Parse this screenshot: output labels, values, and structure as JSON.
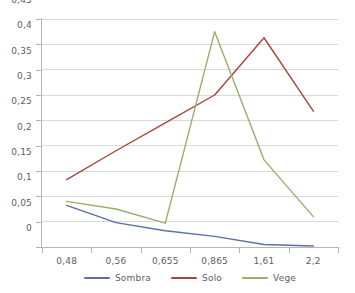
{
  "chart_data": {
    "type": "line",
    "title": "",
    "subtitle": "",
    "xlabel": "",
    "ylabel": "",
    "categories": [
      "0,48",
      "0,56",
      "0,655",
      "0,865",
      "1,61",
      "2,2"
    ],
    "series": [
      {
        "name": "Sombra",
        "color": "#5b6fa8",
        "values": [
          0.082,
          0.048,
          0.032,
          0.021,
          0.005,
          0.002
        ]
      },
      {
        "name": "Solo",
        "color": "#a8453a",
        "values": [
          0.133,
          0.19,
          0.245,
          0.3,
          0.413,
          0.268
        ]
      },
      {
        "name": "Vege",
        "color": "#9aae6b",
        "values": [
          0.09,
          0.075,
          0.047,
          0.425,
          0.172,
          0.06
        ]
      }
    ],
    "ylim": [
      0,
      0.45
    ],
    "ytick_labels": [
      "0,45",
      "0,4",
      "0,35",
      "0,3",
      "0,25",
      "0,2",
      "0,15",
      "0,1",
      "0,05",
      "0"
    ],
    "ytick_values": [
      0.45,
      0.4,
      0.35,
      0.3,
      0.25,
      0.2,
      0.15,
      0.1,
      0.05,
      0
    ],
    "grid": {
      "horizontal": true,
      "vertical": false,
      "color": "#d9d9d9"
    },
    "legend": {
      "position": "bottom",
      "entries": [
        "Sombra",
        "Solo",
        "Vege"
      ]
    },
    "axis_color": "#b5b5b5",
    "background": "#ffffff",
    "decimal_separator": ","
  }
}
